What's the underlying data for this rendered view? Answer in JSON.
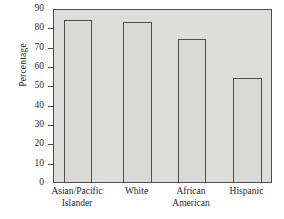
{
  "chart_data": {
    "type": "bar",
    "title": "",
    "xlabel": "",
    "ylabel": "Percentage",
    "ylim": [
      0,
      90
    ],
    "grid": false,
    "legend": false,
    "categories": [
      "Asian/Pacific Islander",
      "White",
      "African American",
      "Hispanic"
    ],
    "category_lines": [
      [
        "Asian/Pacific",
        "Islander"
      ],
      [
        "White",
        ""
      ],
      [
        "African",
        "American"
      ],
      [
        "Hispanic",
        ""
      ]
    ],
    "values": [
      84,
      83,
      74,
      54
    ],
    "ytick_labels": [
      "90",
      "80",
      "70",
      "60",
      "50",
      "40",
      "30",
      "20",
      "10",
      "0"
    ],
    "ytick_values": [
      90,
      80,
      70,
      60,
      50,
      40,
      30,
      20,
      10,
      0
    ],
    "colors": {
      "bar_fill": "#d9d9d7",
      "bar_edge": "#4d4d4d",
      "plot_background": "#dcdcda",
      "axis": "#4a4a4a",
      "text": "#2a2a2a",
      "page_background": "#ffffff"
    }
  }
}
